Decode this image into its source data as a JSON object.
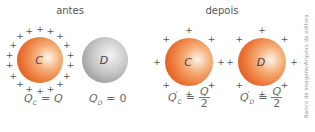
{
  "before": {
    "title": "antes",
    "sphere_c": {
      "label": "C",
      "color": "#e8692a",
      "charge_signs": 18
    },
    "sphere_d": {
      "label": "D",
      "color": "#b5b5b5",
      "charge_signs": 0
    },
    "formula_c": {
      "symbol": "Q",
      "sub": "C",
      "eq": "=",
      "value": "Q"
    },
    "formula_d": {
      "symbol": "Q",
      "sub": "D",
      "eq": "=",
      "value": "0"
    }
  },
  "after": {
    "title": "depois",
    "sphere_c": {
      "label": "C",
      "color": "#e8692a",
      "charge_signs": 8
    },
    "sphere_d": {
      "label": "D",
      "color": "#e8692a",
      "charge_signs": 8
    },
    "formula_c": {
      "symbol": "Q",
      "prime": "'",
      "sub": "C",
      "eq": "=",
      "num": "Q",
      "den": "2"
    },
    "formula_d": {
      "symbol": "Q",
      "prime": "'",
      "sub": "D",
      "eq": "=",
      "num": "Q",
      "den": "2"
    }
  },
  "sign": "+",
  "credit": "Banco de imagens/Arquivo da editora"
}
